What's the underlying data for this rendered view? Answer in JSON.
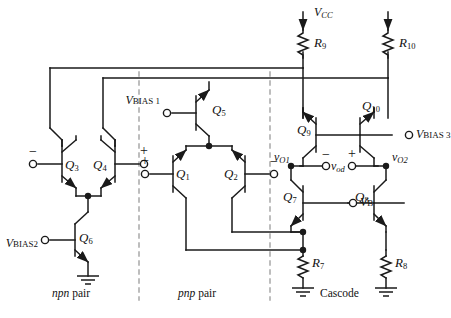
{
  "diagram": {
    "background": "#ffffff",
    "wire_color": "#1a1a1a",
    "divider_color": "#8a8a8a"
  },
  "supply": {
    "label": "V",
    "sub": "CC",
    "name": "VCC"
  },
  "resistors": [
    {
      "name": "R9",
      "label": "R",
      "sub": "9"
    },
    {
      "name": "R10",
      "label": "R",
      "sub": "10"
    },
    {
      "name": "R7",
      "label": "R",
      "sub": "7"
    },
    {
      "name": "R8",
      "label": "R",
      "sub": "8"
    }
  ],
  "transistors": [
    {
      "name": "Q3",
      "label": "Q",
      "sub": "3",
      "type": "npn"
    },
    {
      "name": "Q4",
      "label": "Q",
      "sub": "4",
      "type": "npn"
    },
    {
      "name": "Q6",
      "label": "Q",
      "sub": "6",
      "type": "npn"
    },
    {
      "name": "Q5",
      "label": "Q",
      "sub": "5",
      "type": "pnp"
    },
    {
      "name": "Q1",
      "label": "Q",
      "sub": "1",
      "type": "pnp"
    },
    {
      "name": "Q2",
      "label": "Q",
      "sub": "2",
      "type": "pnp"
    },
    {
      "name": "Q9",
      "label": "Q",
      "sub": "9",
      "type": "pnp"
    },
    {
      "name": "Q10",
      "label": "Q",
      "sub": "10",
      "type": "pnp"
    },
    {
      "name": "Q7",
      "label": "Q",
      "sub": "7",
      "type": "npn"
    },
    {
      "name": "Q8",
      "label": "Q",
      "sub": "8",
      "type": "npn"
    }
  ],
  "bias": [
    {
      "name": "VBIAS1",
      "label": "V",
      "sub": "BIAS 1"
    },
    {
      "name": "VBIAS2",
      "label": "V",
      "sub": "BIAS2"
    },
    {
      "name": "VBIAS3",
      "label": "V",
      "sub": "BIAS 3"
    },
    {
      "name": "VB",
      "label": "V",
      "sub": "B"
    }
  ],
  "outputs": [
    {
      "name": "vO1",
      "label": "v",
      "sub": "O1"
    },
    {
      "name": "vod",
      "label": "v",
      "sub": "od"
    },
    {
      "name": "vO2",
      "label": "v",
      "sub": "O2"
    }
  ],
  "polarity": {
    "npn_left": "−",
    "npn_right": "+",
    "pnp_left": "+",
    "pnp_right": "−",
    "vod_minus": "−",
    "vod_plus": "+"
  },
  "sections": [
    {
      "name": "npn-pair",
      "italic": "npn",
      "rest": " pair"
    },
    {
      "name": "pnp-pair",
      "italic": "pnp",
      "rest": " pair"
    },
    {
      "name": "cascode",
      "italic": "",
      "rest": "Cascode"
    }
  ]
}
